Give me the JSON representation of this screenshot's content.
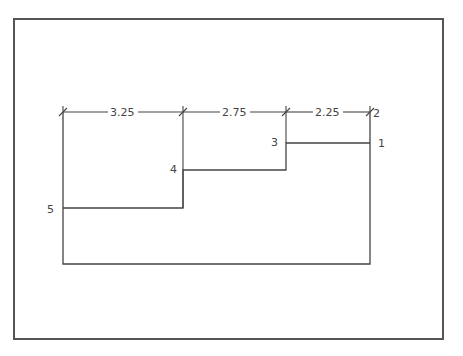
{
  "diagram": {
    "type": "stepped profile with ordinate dimensions",
    "dimensions": [
      {
        "label": "3.25",
        "from_x": 63,
        "to_x": 183
      },
      {
        "label": "2.75",
        "from_x": 183,
        "to_x": 286
      },
      {
        "label": "2.25",
        "from_x": 286,
        "to_x": 370
      }
    ],
    "points": [
      {
        "label": "1",
        "x": 378,
        "y": 147
      },
      {
        "label": "2",
        "x": 373,
        "y": 117
      },
      {
        "label": "3",
        "x": 272,
        "y": 146
      },
      {
        "label": "4",
        "x": 170,
        "y": 173
      },
      {
        "label": "5",
        "x": 47,
        "y": 213
      }
    ],
    "colors": {
      "line": "#444444",
      "frame": "#555555",
      "text": "#444444"
    }
  }
}
